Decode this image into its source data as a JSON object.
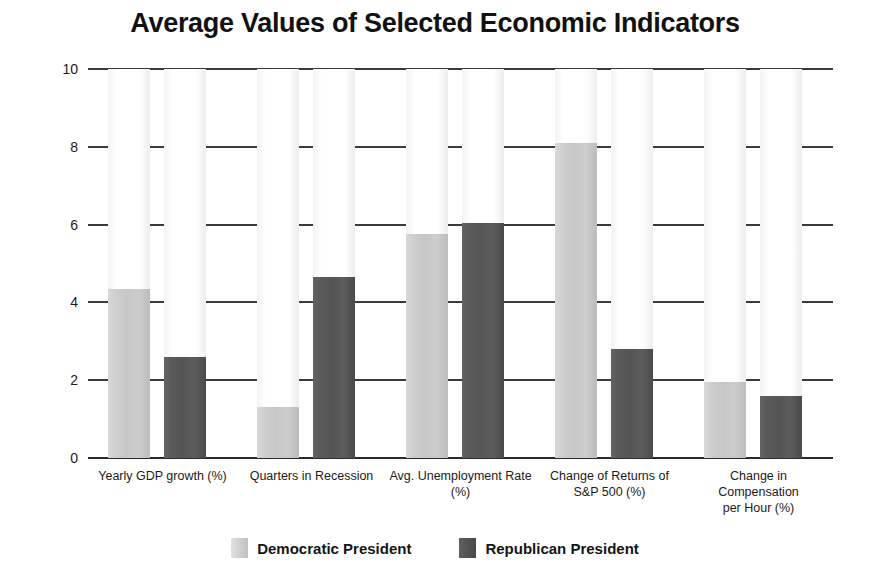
{
  "chart_data": {
    "type": "bar",
    "title": "Average Values of Selected Economic Indicators",
    "xlabel": "",
    "ylabel": "",
    "ylim": [
      0,
      10
    ],
    "yticks": [
      0,
      2,
      4,
      6,
      8,
      10
    ],
    "ytick_labels": [
      "0",
      "2",
      "4",
      "6",
      "8",
      "10"
    ],
    "grid": true,
    "legend_position": "bottom",
    "categories": [
      "Yearly GDP growth (%)",
      "Quarters in Recession",
      "Avg. Unemployment Rate (%)",
      "Change of Returns of S&P 500 (%)",
      "Change in Compensation per Hour (%)"
    ],
    "category_lines": [
      [
        "Yearly GDP growth (%)"
      ],
      [
        "Quarters in Recession"
      ],
      [
        "Avg. Unemployment Rate",
        "(%)"
      ],
      [
        "Change of Returns of",
        "S&P 500 (%)"
      ],
      [
        "Change in",
        "Compensation",
        "per Hour (%)"
      ]
    ],
    "series": [
      {
        "name": "Democratic President",
        "color": "#cccccc",
        "values": [
          4.35,
          1.3,
          5.75,
          8.1,
          1.95
        ]
      },
      {
        "name": "Republican President",
        "color": "#555555",
        "values": [
          2.6,
          4.65,
          6.05,
          2.8,
          1.6
        ]
      }
    ]
  },
  "legend": {
    "items": [
      {
        "label": "Democratic President",
        "swatch": "dem"
      },
      {
        "label": "Republican President",
        "swatch": "rep"
      }
    ]
  }
}
